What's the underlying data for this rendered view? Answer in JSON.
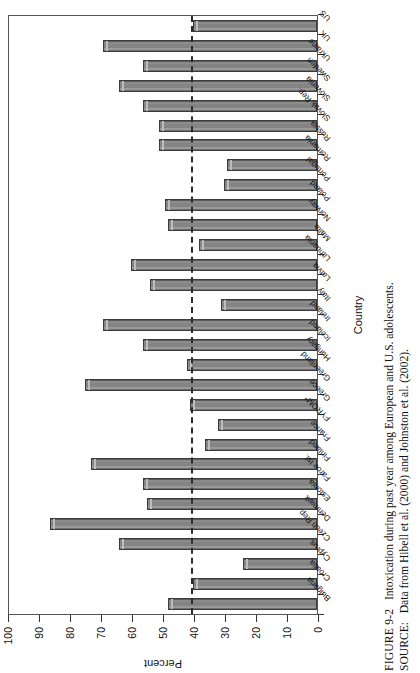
{
  "figure": {
    "caption_label": "FIGURE 9-2",
    "caption_text": "Intoxication during past year among European and U.S. adolescents.",
    "source_label": "SOURCE:",
    "source_text": "Data from Hibell et al. (2000) and Johnston et al. (2002)."
  },
  "chart_data": {
    "type": "bar",
    "title": "",
    "xlabel": "Country",
    "ylabel": "Percent",
    "ylim": [
      0,
      100
    ],
    "ytick_labels": [
      "0",
      "10",
      "20",
      "30",
      "40",
      "50",
      "60",
      "70",
      "80",
      "90",
      "100"
    ],
    "ytick_values": [
      0,
      10,
      20,
      30,
      40,
      50,
      60,
      70,
      80,
      90,
      100
    ],
    "grid": false,
    "legend": "none",
    "orientation": "vertical",
    "reference_line": {
      "value": 40,
      "style": "dashed",
      "color": "#2b2b2b"
    },
    "bar_color": "#848484",
    "bar_edge_color": "#3c3c3c",
    "categories": [
      "Bulgaria",
      "Croatia",
      "Cyprus",
      "Czech Rep.",
      "Denmark",
      "Estonia",
      "Faroe Isl.",
      "Finland",
      "France",
      "FYROM*",
      "Greece",
      "Greenland",
      "Hungary",
      "Iceland",
      "Ireland",
      "Italy",
      "Latvia",
      "Lithuania",
      "Malta",
      "Norway",
      "Poland",
      "Portugal",
      "Romania",
      "Russia",
      "Slovak Rep.",
      "Slovenia",
      "Sweden",
      "Ukraine",
      "UK",
      "US"
    ],
    "values": [
      48,
      40,
      24,
      64,
      86,
      55,
      56,
      73,
      36,
      32,
      41,
      75,
      42,
      56,
      69,
      31,
      54,
      60,
      38,
      48,
      49,
      30,
      29,
      51,
      51,
      56,
      64,
      56,
      69,
      40
    ]
  }
}
